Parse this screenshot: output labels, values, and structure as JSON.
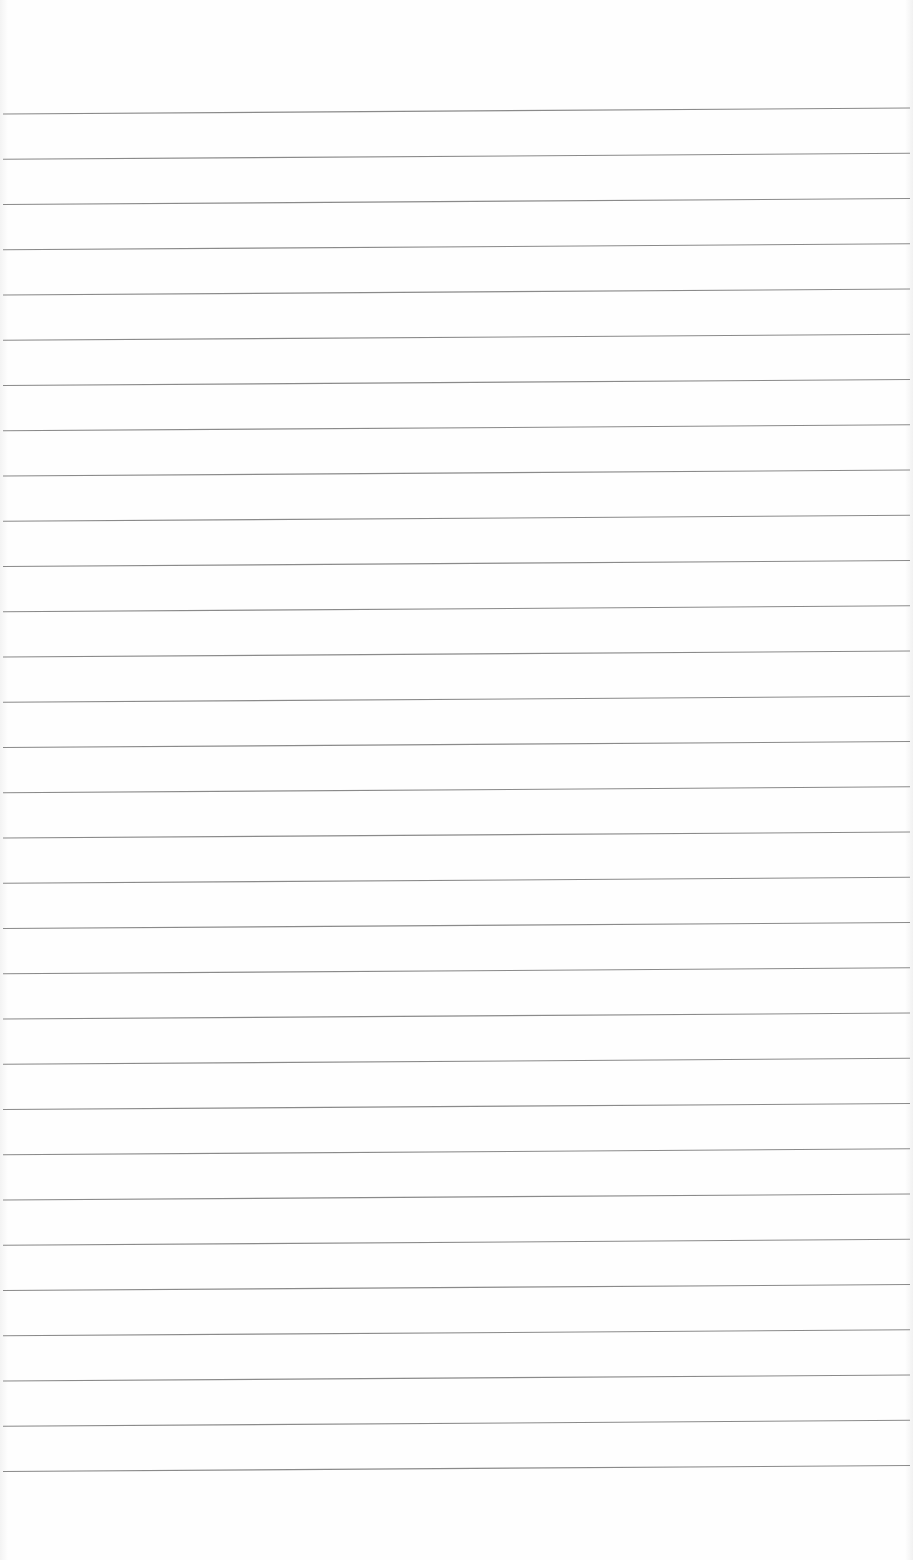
{
  "page": {
    "type": "lined-paper",
    "background_color": "#fdfdfd",
    "rule_color": "#8a8a8a",
    "rule_count": 31,
    "first_rule_y": 111,
    "rule_spacing": 45.25,
    "text_content": []
  }
}
